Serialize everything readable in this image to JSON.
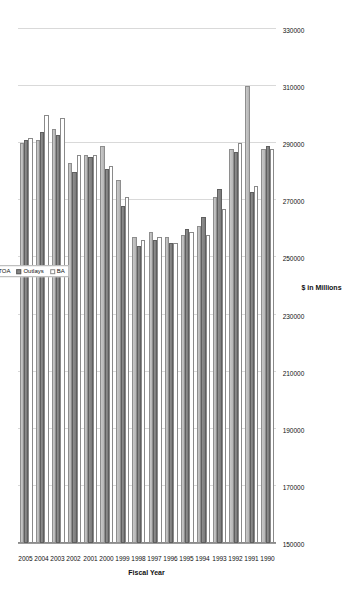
{
  "chart_data": {
    "type": "bar",
    "orientation": "horizontal-rotated",
    "title": "",
    "xlabel": "Fiscal Year",
    "ylabel": "$ in Millions",
    "ylim": [
      150000,
      330000
    ],
    "ytick_labels": [
      "330000",
      "310000",
      "290000",
      "270000",
      "250000",
      "230000",
      "210000",
      "190000",
      "170000",
      "150000"
    ],
    "ytick_values": [
      330000,
      310000,
      290000,
      270000,
      250000,
      230000,
      210000,
      190000,
      170000,
      150000
    ],
    "grid": true,
    "legend_position": "upper-left",
    "categories": [
      "1990",
      "1991",
      "1992",
      "1993",
      "1994",
      "1995",
      "1996",
      "1997",
      "1998",
      "1999",
      "2000",
      "2001",
      "2002",
      "2003",
      "2004",
      "2005"
    ],
    "series": [
      {
        "name": "TOA",
        "color": "#c4c4c4",
        "values": [
          288000,
          310000,
          288000,
          271000,
          261000,
          258000,
          257000,
          259000,
          257000,
          277000,
          289000,
          286000,
          283000,
          295000,
          291000,
          290000
        ]
      },
      {
        "name": "Outlays",
        "color": "#858585",
        "values": [
          289000,
          273000,
          287000,
          274000,
          264000,
          260000,
          255000,
          256000,
          254000,
          268000,
          281000,
          285000,
          280000,
          293000,
          294000,
          291000
        ]
      },
      {
        "name": "BA",
        "color": "#ffffff",
        "values": [
          288000,
          275000,
          290000,
          267000,
          258000,
          259000,
          255000,
          257000,
          256000,
          271000,
          282000,
          286000,
          286000,
          299000,
          300000,
          292000
        ]
      }
    ]
  },
  "axis": {
    "y_title": "$ in Millions",
    "x_title": "Fiscal Year"
  },
  "legend": {
    "items": [
      {
        "label": "TOA"
      },
      {
        "label": "Outlays"
      },
      {
        "label": "BA"
      }
    ]
  }
}
